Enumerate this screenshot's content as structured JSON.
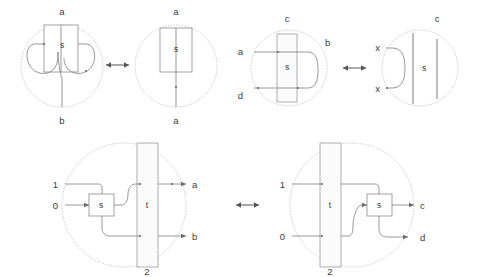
{
  "figure": {
    "background": "#ffffff",
    "wire_color": "#7d7d7d",
    "region_color": "#b8b8b8",
    "box_fill": "#ffffff",
    "box_stroke": "#8a8a8a",
    "label_color": "#3a3a3a",
    "arrow_color": "#555555"
  },
  "rows": [
    {
      "id": "row-1",
      "relation_symbol": "↔",
      "panels": [
        {
          "id": "panel-1-left",
          "box_label": "s",
          "boundary_labels": [
            {
              "name": "top",
              "text": "a"
            },
            {
              "name": "bottom",
              "text": "b"
            }
          ]
        },
        {
          "id": "panel-1-right",
          "box_label": "s",
          "boundary_labels": [
            {
              "name": "top",
              "text": "a"
            },
            {
              "name": "bottom",
              "text": "a"
            }
          ]
        }
      ]
    },
    {
      "id": "row-2",
      "relation_symbol": "↔",
      "panels": [
        {
          "id": "panel-2-left",
          "box_label": "s",
          "boundary_labels": [
            {
              "name": "top",
              "text": "c"
            },
            {
              "name": "left-upper",
              "text": "a"
            },
            {
              "name": "left-lower",
              "text": "d"
            },
            {
              "name": "right-upper",
              "text": "b"
            }
          ]
        },
        {
          "id": "panel-2-right",
          "box_label": "s",
          "boundary_labels": [
            {
              "name": "top",
              "text": "c"
            },
            {
              "name": "left-upper",
              "text": "x"
            },
            {
              "name": "left-lower",
              "text": "x"
            }
          ]
        }
      ]
    },
    {
      "id": "row-3",
      "relation_symbol": "↔",
      "panels": [
        {
          "id": "panel-3-left",
          "box_label": "s",
          "strip_label": "t",
          "boundary_labels": [
            {
              "name": "left-upper",
              "text": "1"
            },
            {
              "name": "left-lower",
              "text": "0"
            },
            {
              "name": "right-upper",
              "text": "a"
            },
            {
              "name": "right-lower",
              "text": "b"
            },
            {
              "name": "bottom",
              "text": "2"
            }
          ]
        },
        {
          "id": "panel-3-right",
          "box_label": "s",
          "strip_label": "t",
          "boundary_labels": [
            {
              "name": "left-upper",
              "text": "1"
            },
            {
              "name": "left-lower",
              "text": "0"
            },
            {
              "name": "right-upper",
              "text": "c"
            },
            {
              "name": "right-lower",
              "text": "d"
            },
            {
              "name": "bottom",
              "text": "2"
            }
          ]
        }
      ]
    }
  ],
  "glyphs": {
    "double_arrow": "↔"
  }
}
